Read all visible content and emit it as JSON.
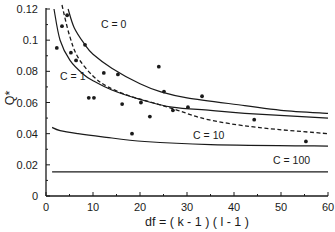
{
  "chart_data": {
    "type": "scatter",
    "title": "",
    "xlabel": "df = ( k - 1 ) ( l - 1 )",
    "ylabel": "Q*",
    "xlim": [
      0,
      60
    ],
    "ylim": [
      0,
      0.12
    ],
    "grid": false,
    "legend": "none (curves labeled inline)",
    "x_ticks": [
      0,
      10,
      20,
      30,
      40,
      50,
      60
    ],
    "x_tick_labels": [
      "0",
      "10",
      "20",
      "30",
      "40",
      "50",
      "60"
    ],
    "x_minor_ticks": [
      5,
      15,
      25,
      35,
      45,
      55
    ],
    "y_ticks": [
      0,
      0.02,
      0.04,
      0.06,
      0.08,
      0.1,
      0.12
    ],
    "y_tick_labels": [
      "0",
      "0.02",
      "0.04",
      "0.06",
      "0.08",
      "0.1",
      "0.12"
    ],
    "y_minor_ticks": [
      0.01,
      0.03,
      0.05,
      0.07,
      0.09,
      0.11
    ],
    "series": [
      {
        "name": "observations",
        "kind": "points",
        "points": [
          [
            2.3,
            0.095
          ],
          [
            3.4,
            0.109
          ],
          [
            4.5,
            0.116
          ],
          [
            5.3,
            0.092
          ],
          [
            6.4,
            0.087
          ],
          [
            8.3,
            0.097
          ],
          [
            9.1,
            0.063
          ],
          [
            10.2,
            0.063
          ],
          [
            12.3,
            0.079
          ],
          [
            15.3,
            0.078
          ],
          [
            16.2,
            0.059
          ],
          [
            18.3,
            0.04
          ],
          [
            20.2,
            0.06
          ],
          [
            22.1,
            0.051
          ],
          [
            24.0,
            0.083
          ],
          [
            25.1,
            0.067
          ],
          [
            27.0,
            0.055
          ],
          [
            30.2,
            0.057
          ],
          [
            33.2,
            0.064
          ],
          [
            44.3,
            0.049
          ],
          [
            55.3,
            0.035
          ]
        ]
      },
      {
        "name": "C = 0",
        "kind": "line",
        "style": "solid",
        "label": {
          "text": "C = 0",
          "x": 11.7,
          "y": 0.1075
        },
        "points": [
          [
            4.7,
            0.12
          ],
          [
            6,
            0.108
          ],
          [
            8.3,
            0.097
          ],
          [
            10,
            0.091
          ],
          [
            14,
            0.082
          ],
          [
            20,
            0.072
          ],
          [
            24.3,
            0.067
          ],
          [
            30,
            0.063
          ],
          [
            42.3,
            0.058
          ],
          [
            50,
            0.055
          ],
          [
            60,
            0.053
          ]
        ]
      },
      {
        "name": "C = 1",
        "kind": "line",
        "style": "solid",
        "label": {
          "text": "C = 1",
          "x": 3.0,
          "y": 0.0745
        },
        "points": [
          [
            1.7,
            0.12
          ],
          [
            3,
            0.1
          ],
          [
            5.1,
            0.087
          ],
          [
            8,
            0.078
          ],
          [
            10,
            0.074
          ],
          [
            14,
            0.068
          ],
          [
            20,
            0.062
          ],
          [
            26.8,
            0.057
          ],
          [
            35,
            0.055
          ],
          [
            42.3,
            0.053
          ],
          [
            60,
            0.05
          ]
        ]
      },
      {
        "name": "dashed reference",
        "kind": "line",
        "style": "dashed",
        "points": [
          [
            3.4,
            0.124
          ],
          [
            5,
            0.103
          ],
          [
            6.8,
            0.089
          ],
          [
            10,
            0.077
          ],
          [
            13.2,
            0.07
          ],
          [
            18,
            0.064
          ],
          [
            22.6,
            0.06
          ],
          [
            28,
            0.055
          ],
          [
            34.5,
            0.049
          ],
          [
            45,
            0.044
          ],
          [
            60,
            0.04
          ]
        ]
      },
      {
        "name": "C = 10",
        "kind": "line",
        "style": "solid",
        "label": {
          "text": "C = 10",
          "x": 31.3,
          "y": 0.0365
        },
        "points": [
          [
            1.3,
            0.044
          ],
          [
            3,
            0.042
          ],
          [
            6.8,
            0.04
          ],
          [
            12,
            0.038
          ],
          [
            21,
            0.035
          ],
          [
            35,
            0.033
          ],
          [
            60,
            0.032
          ]
        ]
      },
      {
        "name": "C = 100",
        "kind": "line",
        "style": "solid",
        "label": {
          "text": "C = 100",
          "x": 48.3,
          "y": 0.0205
        },
        "points": [
          [
            1.3,
            0.0155
          ],
          [
            60,
            0.0155
          ]
        ]
      }
    ]
  }
}
